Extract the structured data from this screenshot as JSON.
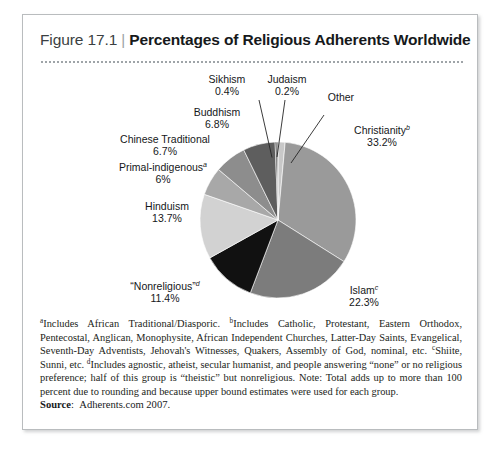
{
  "figure": {
    "number_label": "Figure 17.1",
    "separator": "|",
    "title": "Percentages of Religious Adherents Worldwide"
  },
  "chart_data": {
    "type": "pie",
    "title": "Percentages of Religious Adherents Worldwide",
    "unit": "percent",
    "legend_position": "callout-labels",
    "grid": false,
    "categories": [
      "Christianity",
      "Islam",
      "“Nonreligious”",
      "Hinduism",
      "Primal-indigenous",
      "Chinese Traditional",
      "Buddhism",
      "Sikhism",
      "Judaism",
      "Other"
    ],
    "values": [
      33.2,
      22.3,
      11.4,
      13.7,
      6.0,
      6.7,
      6.8,
      0.4,
      0.2,
      1.5
    ],
    "labels": [
      {
        "name": "Christianity",
        "footnote": "b",
        "value_text": "33.2%",
        "value": 33.2,
        "color": "#9a9a9a"
      },
      {
        "name": "Islam",
        "footnote": "c",
        "value_text": "22.3%",
        "value": 22.3,
        "color": "#7c7c7c"
      },
      {
        "name": "“Nonreligious”",
        "footnote": "d",
        "value_text": "11.4%",
        "value": 11.4,
        "color": "#111111"
      },
      {
        "name": "Hinduism",
        "footnote": "",
        "value_text": "13.7%",
        "value": 13.7,
        "color": "#d2d2d2"
      },
      {
        "name": "Primal-indigenous",
        "footnote": "a",
        "value_text": "6%",
        "value": 6.0,
        "color": "#a8a8a8"
      },
      {
        "name": "Chinese Traditional",
        "footnote": "",
        "value_text": "6.7%",
        "value": 6.7,
        "color": "#8d8d8d"
      },
      {
        "name": "Buddhism",
        "footnote": "",
        "value_text": "6.8%",
        "value": 6.8,
        "color": "#5e5e5e"
      },
      {
        "name": "Sikhism",
        "footnote": "",
        "value_text": "0.4%",
        "value": 0.4,
        "color": "#3a3a3a"
      },
      {
        "name": "Judaism",
        "footnote": "",
        "value_text": "0.2%",
        "value": 0.2,
        "color": "#272727"
      },
      {
        "name": "Other",
        "footnote": "",
        "value_text": "",
        "value": 1.5,
        "color": "#c8c8c8"
      }
    ]
  },
  "notes": {
    "text": "Includes African Traditional/Diasporic. Includes Catholic, Protestant, Eastern Orthodox, Pentecostal, Anglican, Monophysite, African Independent Churches, Latter-Day Saints, Evangelical, Seventh-Day Adventists, Jehovah's Witnesses, Quakers, Assembly of God, nominal, etc. Shiite, Sunni, etc. Includes agnostic, atheist, secular humanist, and people answering “none” or no religious preference; half of this group is “theistic” but nonreligious. Note: Total adds up to more than 100 percent due to rounding and because upper bound estimates were used for each group.",
    "marker_a": "a",
    "seg_a": "Includes African Traditional/Diasporic. ",
    "marker_b": "b",
    "seg_b": "Includes Catholic, Protestant, Eastern Orthodox, Pentecostal, Anglican, Monophysite, African Independent Churches, Latter-Day Saints, Evangelical, Seventh-Day Adventists, Jehovah's Witnesses, Quakers, Assembly of God, nominal, etc. ",
    "marker_c": "c",
    "seg_c": "Shiite, Sunni, etc. ",
    "marker_d": "d",
    "seg_d": "Includes agnostic, atheist, secular humanist, and people answering “none” or no religious preference; half of this group is “theistic” but nonreligious. Note: Total adds up to more than 100 percent due to rounding and because upper bound estimates were used for each group."
  },
  "source": {
    "label": "Source",
    "separator": ":",
    "value": "Adherents.com 2007."
  }
}
